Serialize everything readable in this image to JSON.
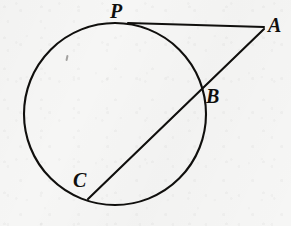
{
  "figure": {
    "background_color": "#f6f6f5",
    "ink_color": "#100f0d",
    "width": 291,
    "height": 226
  },
  "labels": {
    "tangent_point": "P",
    "external_point": "A",
    "near_intersection": "B",
    "far_intersection": "C"
  },
  "chart_data": {
    "type": "diagram",
    "circle": {
      "cx": 115,
      "cy": 114,
      "r": 91,
      "stroke": "#100f0d",
      "stroke_width": 2.1
    },
    "points": [
      {
        "name": "P",
        "x": 128,
        "y": 23,
        "role": "tangent-point-on-circle"
      },
      {
        "name": "A",
        "x": 264,
        "y": 27,
        "role": "external-point"
      },
      {
        "name": "B",
        "x": 202,
        "y": 92,
        "role": "secant-near-intersection"
      },
      {
        "name": "C",
        "x": 88,
        "y": 199,
        "role": "secant-far-intersection"
      }
    ],
    "segments": [
      {
        "name": "tangent-PA",
        "from": "P",
        "to": "A",
        "x1": 128,
        "y1": 23,
        "x2": 264,
        "y2": 27,
        "stroke": "#100f0d",
        "stroke_width": 2.1
      },
      {
        "name": "secant-AC",
        "from": "A",
        "to": "C",
        "x1": 264,
        "y1": 29,
        "x2": 88,
        "y2": 199,
        "stroke": "#100f0d",
        "stroke_width": 2.1
      }
    ],
    "label_positions": [
      {
        "text": "P",
        "x": 110,
        "y": 1
      },
      {
        "text": "A",
        "x": 268,
        "y": 15
      },
      {
        "text": "B",
        "x": 206,
        "y": 86
      },
      {
        "text": "C",
        "x": 73,
        "y": 170
      }
    ],
    "grid": false,
    "legend": null
  }
}
